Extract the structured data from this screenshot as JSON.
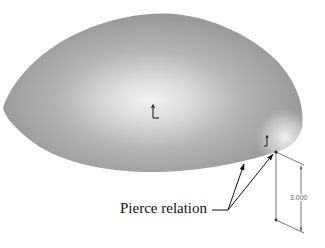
{
  "figure": {
    "callout": {
      "label": "Pierce relation"
    },
    "dimension": {
      "value": "3.000"
    },
    "icons": {
      "origin_marker": "origin-axis-icon",
      "sketch_point_marker": "sketch-point-axis-icon"
    },
    "colors": {
      "surface_base": "#9a9a9a",
      "surface_highlight": "#f4f4f4",
      "background": "#ffffff",
      "annotation": "#111111",
      "dimension": "#555555"
    }
  }
}
